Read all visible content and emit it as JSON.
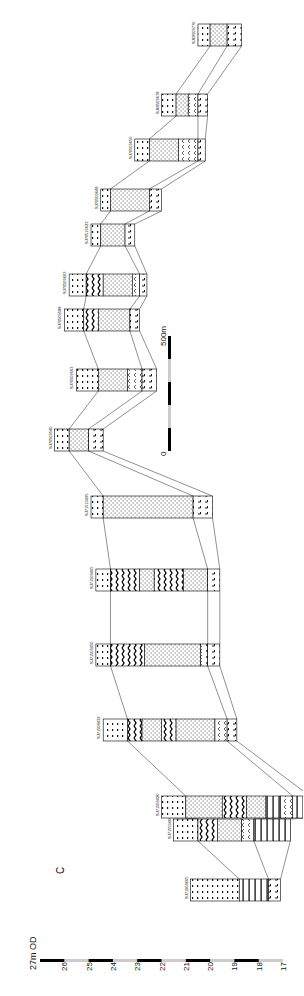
{
  "figure": {
    "section_label": "C",
    "scale_bar": {
      "start_label": "0",
      "end_label": "500m"
    },
    "elevation_axis": {
      "top_label": "27m OD",
      "ticks": [
        "26",
        "25",
        "24",
        "23",
        "22",
        "21",
        "20",
        "19",
        "18",
        "17"
      ],
      "range_m": [
        17,
        27
      ]
    }
  },
  "legend_patterns": {
    "clay": "dashes",
    "sand": "dots",
    "gravel": "zigzag",
    "peat": "chevrons",
    "bedrock": "vertical-bars",
    "made_ground": "ticks"
  },
  "boreholes": [
    {
      "id": "SJ71604605",
      "top": 20.8,
      "units": [
        [
          "clay",
          2.0
        ],
        [
          "bedrock",
          1.2
        ],
        [
          "made_ground",
          0.5
        ]
      ]
    },
    {
      "id": "SJ71550466",
      "top": 21.5,
      "units": [
        [
          "clay",
          1.0
        ],
        [
          "gravel",
          0.8
        ],
        [
          "sand",
          1.0
        ],
        [
          "peat",
          0.5
        ],
        [
          "bedrock",
          1.5
        ]
      ]
    },
    {
      "id": "SJ71509420",
      "top": 22.0,
      "units": [
        [
          "clay",
          1.0
        ],
        [
          "sand",
          1.5
        ],
        [
          "gravel",
          1.0
        ],
        [
          "sand",
          0.8
        ],
        [
          "bedrock",
          0.6
        ],
        [
          "peat",
          0.5
        ],
        [
          "bedrock",
          0.7
        ]
      ]
    },
    {
      "id": "SJ71508432",
      "top": 24.4,
      "units": [
        [
          "clay",
          1.0
        ],
        [
          "gravel",
          0.6
        ],
        [
          "sand",
          0.8
        ],
        [
          "gravel",
          0.6
        ],
        [
          "sand",
          1.6
        ],
        [
          "peat",
          0.5
        ],
        [
          "made_ground",
          0.4
        ]
      ]
    },
    {
      "id": "SJ71509450",
      "top": 24.7,
      "units": [
        [
          "clay",
          0.6
        ],
        [
          "gravel",
          1.4
        ],
        [
          "sand",
          2.3
        ],
        [
          "peat",
          0.3
        ],
        [
          "made_ground",
          0.5
        ]
      ]
    },
    {
      "id": "SJ71509465",
      "top": 24.7,
      "units": [
        [
          "clay",
          0.6
        ],
        [
          "gravel",
          1.2
        ],
        [
          "sand",
          0.6
        ],
        [
          "gravel",
          1.2
        ],
        [
          "sand",
          1.0
        ],
        [
          "made_ground",
          0.5
        ]
      ]
    },
    {
      "id": "SJ71510495",
      "top": 24.9,
      "units": [
        [
          "clay",
          0.5
        ],
        [
          "sand",
          3.7
        ],
        [
          "made_ground",
          0.8
        ]
      ]
    },
    {
      "id": "SJ70509540",
      "top": 26.4,
      "units": [
        [
          "clay",
          0.6
        ],
        [
          "sand",
          0.8
        ],
        [
          "made_ground",
          0.6
        ]
      ]
    },
    {
      "id": "SJ70509563",
      "top": 25.5,
      "units": [
        [
          "clay",
          0.9
        ],
        [
          "sand",
          1.2
        ],
        [
          "peat",
          0.6
        ],
        [
          "made_ground",
          0.6
        ]
      ]
    },
    {
      "id": "SJ70509588",
      "top": 26.0,
      "units": [
        [
          "clay",
          0.8
        ],
        [
          "gravel",
          0.6
        ],
        [
          "sand",
          1.3
        ],
        [
          "made_ground",
          0.4
        ]
      ]
    },
    {
      "id": "SJ70509603",
      "top": 25.8,
      "units": [
        [
          "clay",
          0.7
        ],
        [
          "gravel",
          0.7
        ],
        [
          "sand",
          1.2
        ],
        [
          "peat",
          0.3
        ],
        [
          "made_ground",
          0.3
        ]
      ]
    },
    {
      "id": "SJ70510623",
      "top": 24.9,
      "units": [
        [
          "clay",
          0.4
        ],
        [
          "sand",
          1.0
        ],
        [
          "made_ground",
          0.4
        ]
      ]
    },
    {
      "id": "SJ70509648",
      "top": 24.5,
      "units": [
        [
          "clay",
          0.4
        ],
        [
          "sand",
          1.6
        ],
        [
          "made_ground",
          0.5
        ]
      ]
    },
    {
      "id": "SJ70509650",
      "top": 23.1,
      "units": [
        [
          "clay",
          0.6
        ],
        [
          "sand",
          1.2
        ],
        [
          "peat",
          0.8
        ],
        [
          "made_ground",
          0.3
        ]
      ]
    },
    {
      "id": "SJ69509678",
      "top": 22.0,
      "units": [
        [
          "clay",
          0.6
        ],
        [
          "sand",
          0.5
        ],
        [
          "peat",
          0.4
        ],
        [
          "made_ground",
          0.4
        ]
      ]
    },
    {
      "id": "SJ69509770",
      "top": 20.5,
      "units": [
        [
          "clay",
          0.5
        ],
        [
          "sand",
          0.7
        ],
        [
          "made_ground",
          0.6
        ]
      ]
    }
  ]
}
